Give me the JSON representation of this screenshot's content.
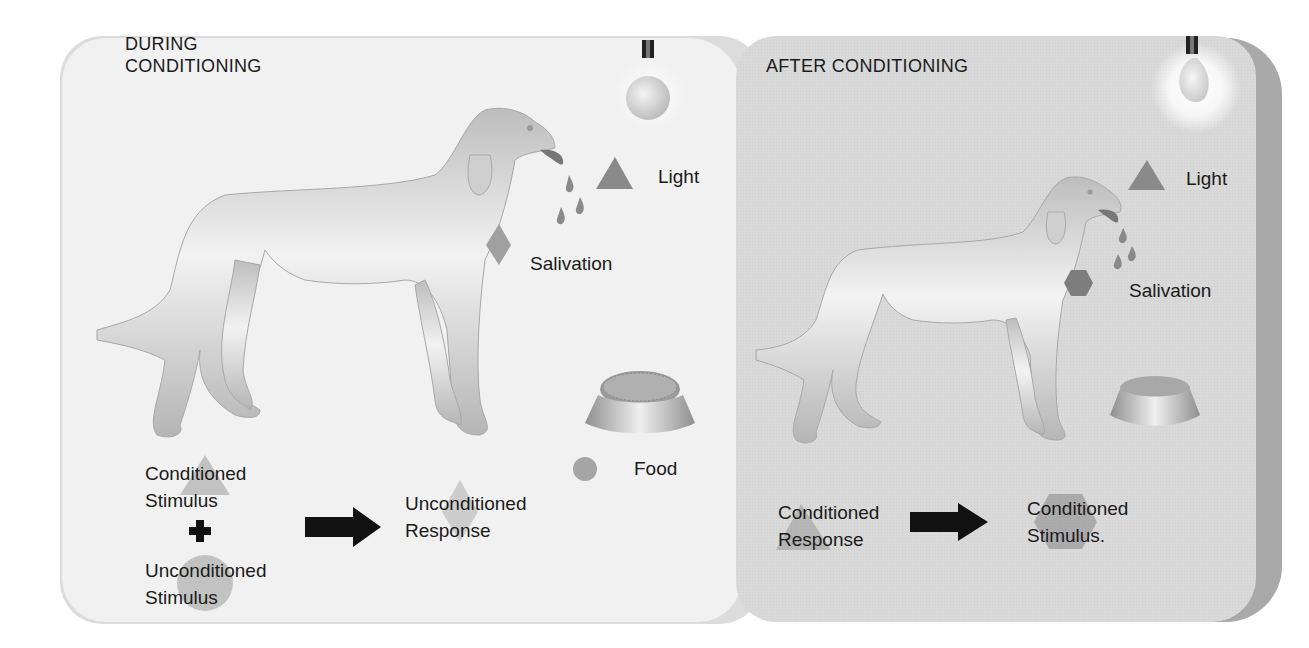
{
  "figure": {
    "panels": [
      {
        "id": "during",
        "title_line1": "DURING",
        "title_line2": "CONDITIONING",
        "labels": {
          "light": "Light",
          "salivation": "Salivation",
          "food": "Food",
          "left_term1_line1": "Conditioned",
          "left_term1_line2": "Stimulus",
          "operator": "+",
          "left_term2_line1": "Unconditioned",
          "left_term2_line2": "Stimulus",
          "right_term_line1": "Unconditioned",
          "right_term_line2": "Response"
        },
        "symbols": {
          "light": "triangle",
          "salivation": "diamond",
          "food": "circle"
        }
      },
      {
        "id": "after",
        "title": "AFTER  CONDITIONING",
        "labels": {
          "light": "Light",
          "salivation": "Salivation",
          "left_term_line1": "Conditioned",
          "left_term_line2": "Response",
          "right_term_line1": "Conditioned",
          "right_term_line2": "Stimulus."
        },
        "symbols": {
          "light": "triangle",
          "salivation": "hexagon"
        }
      }
    ],
    "colors": {
      "panel_left": "#f1f1f1",
      "panel_right": "#d9d9d9",
      "panel_right_edge": "#a9a9a9",
      "symbol_gray": "#8a8a8a",
      "text": "#1a1a1a",
      "arrow": "#111111"
    }
  }
}
